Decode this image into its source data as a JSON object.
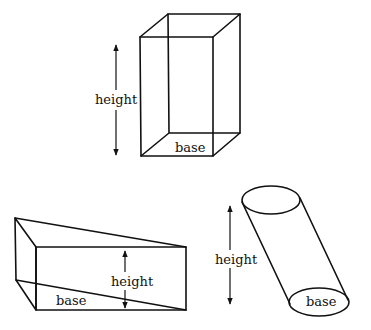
{
  "diagram": {
    "figures": [
      {
        "id": "rectangular-prism",
        "type": "box",
        "labels": {
          "height": "height",
          "base": "base"
        }
      },
      {
        "id": "triangular-prism",
        "type": "triangular-prism",
        "labels": {
          "height": "height",
          "base": "base"
        }
      },
      {
        "id": "oblique-cylinder",
        "type": "cylinder",
        "labels": {
          "height": "height",
          "base": "base"
        }
      }
    ]
  },
  "colors": {
    "stroke": "#111111",
    "background": "#ffffff"
  }
}
